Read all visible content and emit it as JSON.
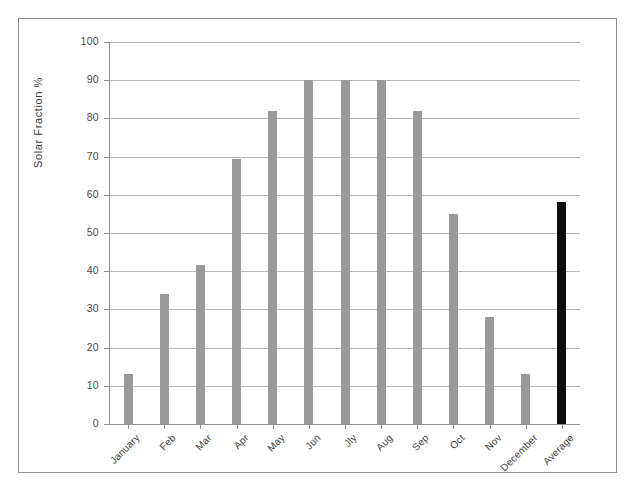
{
  "chart_data": {
    "type": "bar",
    "title": "",
    "xlabel": "",
    "ylabel": "Solar Fraction  %",
    "ylim": [
      0,
      100
    ],
    "ytick_values": [
      0,
      10,
      20,
      30,
      40,
      50,
      60,
      70,
      80,
      90,
      100
    ],
    "ytick_labels": [
      "0",
      "10",
      "20",
      "30",
      "40",
      "50",
      "60",
      "70",
      "80",
      "90",
      "100"
    ],
    "grid": true,
    "legend": "none",
    "categories": [
      "January",
      "Feb",
      "Mar",
      "Apr",
      "May",
      "Jun",
      "Jly",
      "Aug",
      "Sep",
      "Oct",
      "Nov",
      "December",
      "Average"
    ],
    "values": [
      13,
      34,
      41.5,
      69.5,
      82,
      90,
      90,
      90,
      82,
      55,
      28,
      13,
      58
    ],
    "bar_colors": [
      "#9a9a9a",
      "#9a9a9a",
      "#9a9a9a",
      "#9a9a9a",
      "#9a9a9a",
      "#9a9a9a",
      "#9a9a9a",
      "#9a9a9a",
      "#9a9a9a",
      "#9a9a9a",
      "#9a9a9a",
      "#9a9a9a",
      "#0d0d0d"
    ],
    "highlight_category": "Average",
    "colors": {
      "bar_default": "#9a9a9a",
      "bar_highlight": "#0d0d0d",
      "gridline": "#b9b9b9",
      "axis": "#8f8f8f",
      "frame": "#8d8d8d",
      "text": "#3d3d3d",
      "background": "#ffffff"
    }
  }
}
